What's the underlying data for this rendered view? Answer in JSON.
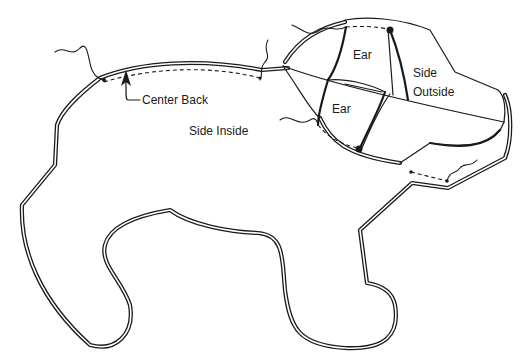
{
  "figure": {
    "type": "sewing pattern diagram",
    "colors": {
      "line": "#1a1a1a",
      "background": "#ffffff"
    }
  },
  "labels": {
    "center_back": "Center Back",
    "side_inside": "Side Inside",
    "ear_top": "Ear",
    "ear_bottom": "Ear",
    "side_outside_line1": "Side",
    "side_outside_line2": "Outside"
  },
  "annotations": [
    {
      "id": "center-back-arrow",
      "points_to": "center back seam",
      "label_ref": "labels.center_back"
    },
    {
      "id": "back-seam",
      "style": "dashed",
      "description": "stitching line along center back"
    },
    {
      "id": "head-seam",
      "style": "dashed",
      "description": "stitching line across top of head"
    },
    {
      "id": "ear-seam",
      "style": "dashed",
      "description": "stitching line along lower ear"
    },
    {
      "id": "chin-seam",
      "style": "dashed",
      "description": "stitching line under chin"
    }
  ]
}
